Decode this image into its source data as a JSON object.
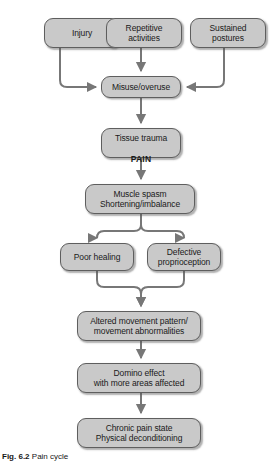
{
  "figure": {
    "width": 277,
    "height": 463,
    "caption_label": "Fig. 6.2",
    "caption_text": "Pain cycle",
    "colors": {
      "node_fill": "#c9c9c9",
      "node_border": "#5e5e5e",
      "arrow": "#777777",
      "text": "#1a1a1a",
      "background": "#ffffff"
    }
  },
  "nodes": [
    {
      "id": "injury",
      "label": "Injury",
      "x": 44,
      "y": 18,
      "w": 76,
      "h": 30
    },
    {
      "id": "repetitive",
      "label": "Repetitive\nactivities",
      "x": 106,
      "y": 18,
      "w": 76,
      "h": 30
    },
    {
      "id": "sustained",
      "label": "Sustained\npostures",
      "x": 190,
      "y": 18,
      "w": 76,
      "h": 30
    },
    {
      "id": "misuse",
      "label": "Misuse/overuse",
      "x": 101,
      "y": 76,
      "w": 80,
      "h": 22
    },
    {
      "id": "tissue",
      "label": "Tissue trauma",
      "label2": "PAIN",
      "x": 101,
      "y": 128,
      "w": 80,
      "h": 30
    },
    {
      "id": "spasm",
      "label": "Muscle spasm\nShortening/imbalance",
      "x": 85,
      "y": 184,
      "w": 110,
      "h": 30
    },
    {
      "id": "poorhealing",
      "label": "Poor healing",
      "x": 60,
      "y": 243,
      "w": 74,
      "h": 28
    },
    {
      "id": "proprioception",
      "label": "Defective\nproprioception",
      "x": 147,
      "y": 243,
      "w": 74,
      "h": 28
    },
    {
      "id": "altered",
      "label": "Altered movement pattern/\nmovement abnormalities",
      "x": 77,
      "y": 311,
      "w": 124,
      "h": 30
    },
    {
      "id": "domino",
      "label": "Domino effect\nwith more areas affected",
      "x": 77,
      "y": 363,
      "w": 124,
      "h": 30
    },
    {
      "id": "chronic",
      "label": "Chronic pain state\nPhysical deconditioning",
      "x": 77,
      "y": 418,
      "w": 124,
      "h": 30
    }
  ],
  "edges": [
    {
      "id": "injury-to-misuse",
      "from": "injury",
      "to": "misuse"
    },
    {
      "id": "repetitive-to-misuse",
      "from": "repetitive",
      "to": "misuse"
    },
    {
      "id": "sustained-to-misuse",
      "from": "sustained",
      "to": "misuse"
    },
    {
      "id": "misuse-to-tissue",
      "from": "misuse",
      "to": "tissue"
    },
    {
      "id": "tissue-to-spasm",
      "from": "tissue",
      "to": "spasm"
    },
    {
      "id": "spasm-to-poorhealing",
      "from": "spasm",
      "to": "poorhealing"
    },
    {
      "id": "spasm-to-proprioception",
      "from": "spasm",
      "to": "proprioception"
    },
    {
      "id": "poorhealing-to-altered",
      "from": "poorhealing",
      "to": "altered"
    },
    {
      "id": "proprioception-to-altered",
      "from": "proprioception",
      "to": "altered"
    },
    {
      "id": "altered-to-domino",
      "from": "altered",
      "to": "domino"
    },
    {
      "id": "domino-to-chronic",
      "from": "domino",
      "to": "chronic"
    }
  ]
}
